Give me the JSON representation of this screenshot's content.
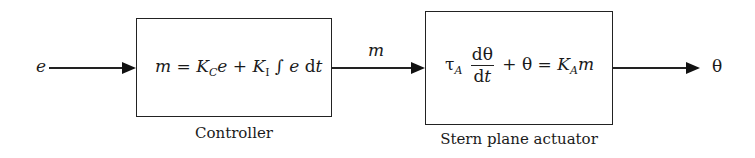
{
  "diagram": {
    "type": "block-diagram",
    "input_signal": "e",
    "intermediate_signal": "m",
    "output_signal": "θ",
    "blocks": [
      {
        "id": "controller",
        "caption": "Controller",
        "equation": {
          "lhs": "m",
          "eq": "=",
          "k_c": "K",
          "k_c_sub": "C",
          "e1": "e",
          "plus": "+",
          "k_i": "K",
          "k_i_sub": "I",
          "integral": "∫",
          "e2": "e",
          "d": "d",
          "t": "t"
        }
      },
      {
        "id": "stern-plane-actuator",
        "caption": "Stern plane actuator",
        "equation": {
          "tau": "τ",
          "tau_sub": "A",
          "num": "dθ",
          "den_d": "d",
          "den_t": "t",
          "plus": "+",
          "theta": "θ",
          "eq": "=",
          "k_a": "K",
          "k_a_sub": "A",
          "m": "m"
        }
      }
    ]
  }
}
